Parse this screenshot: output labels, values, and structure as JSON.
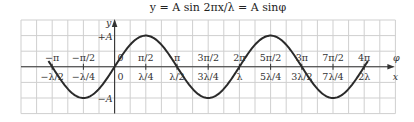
{
  "title": "y = A sin 2πx/λ = A sinφ",
  "chart_data": {
    "type": "line",
    "title": "y = A sin 2πx/λ = A sinφ",
    "function": "y = A sin(2πx/λ)",
    "x_axis_label": "x",
    "phase_axis_label": "φ",
    "y_axis_label": "y",
    "y_ticks": [
      {
        "value": "+A",
        "label": "+A"
      },
      {
        "value": "-A",
        "label": "−A"
      }
    ],
    "phase_ticks": [
      {
        "units": -0.5,
        "label": "−π"
      },
      {
        "units": -0.25,
        "label": "−π/2"
      },
      {
        "units": 0,
        "label": "0"
      },
      {
        "units": 0.25,
        "label": "π/2"
      },
      {
        "units": 0.5,
        "label": "π"
      },
      {
        "units": 0.75,
        "label": "3π/2"
      },
      {
        "units": 1.0,
        "label": "2π"
      },
      {
        "units": 1.25,
        "label": "5π/2"
      },
      {
        "units": 1.5,
        "label": "3π"
      },
      {
        "units": 1.75,
        "label": "7π/2"
      },
      {
        "units": 2.0,
        "label": "4π"
      }
    ],
    "x_ticks": [
      {
        "units": -0.5,
        "label": "−λ/2"
      },
      {
        "units": -0.25,
        "label": "−λ/4"
      },
      {
        "units": 0,
        "label": "0"
      },
      {
        "units": 0.25,
        "label": "λ/4"
      },
      {
        "units": 0.5,
        "label": "λ/2"
      },
      {
        "units": 0.75,
        "label": "3λ/4"
      },
      {
        "units": 1.0,
        "label": "λ"
      },
      {
        "units": 1.25,
        "label": "5λ/4"
      },
      {
        "units": 1.5,
        "label": "3λ/2"
      },
      {
        "units": 1.75,
        "label": "7λ/4"
      },
      {
        "units": 2.0,
        "label": "2λ"
      }
    ],
    "x_range_wavelengths": [
      -0.53,
      2.03
    ],
    "amplitude": "A",
    "grid": true,
    "grid_cols": 24,
    "grid_rows": 6,
    "cells_per_wavelength": 8,
    "cells_per_amplitude": 2
  }
}
